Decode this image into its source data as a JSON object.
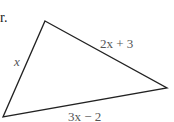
{
  "text_fragment": "r.",
  "triangle": {
    "vertices": [
      [
        45,
        21
      ],
      [
        167,
        88
      ],
      [
        3,
        117
      ]
    ],
    "stroke": "#222222"
  },
  "labels": {
    "left_side": "x",
    "top_right_side": "2x + 3",
    "bottom_side": "3x − 2"
  }
}
